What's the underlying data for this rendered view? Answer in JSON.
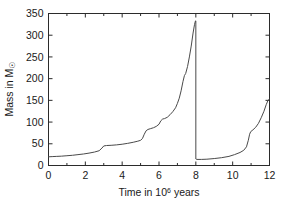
{
  "chart_data": {
    "type": "line",
    "title": "",
    "xlabel": "Time in 10^6 years",
    "xlabel_parts": {
      "pre": "Time in 10",
      "sup": "6",
      "post": " years"
    },
    "ylabel": "Mass in M☉",
    "ylabel_parts": {
      "pre": "Mass in M",
      "sym": "☉"
    },
    "xlim": [
      0,
      12
    ],
    "ylim": [
      0,
      350
    ],
    "xticks": [
      0,
      2,
      4,
      6,
      8,
      10,
      12
    ],
    "xtick_labels": [
      "0",
      "2",
      "4",
      "6",
      "8",
      "10",
      "12"
    ],
    "xminor_ticks": [
      1,
      3,
      5,
      7,
      9,
      11
    ],
    "yticks": [
      0,
      50,
      100,
      150,
      200,
      250,
      300,
      350
    ],
    "ytick_labels": [
      "0",
      "50",
      "100",
      "150",
      "200",
      "250",
      "300",
      "350"
    ],
    "grid": false,
    "legend": "none",
    "line_color": "#4a4a4a",
    "axis_color": "#2b2b2b",
    "background": "#ffffff",
    "series": [
      {
        "name": "Cluster mass",
        "points": [
          [
            0.0,
            20
          ],
          [
            0.2,
            20.5
          ],
          [
            0.45,
            21
          ],
          [
            0.7,
            21.5
          ],
          [
            1.0,
            22.5
          ],
          [
            1.3,
            23.5
          ],
          [
            1.6,
            25
          ],
          [
            1.9,
            26.5
          ],
          [
            2.2,
            28.5
          ],
          [
            2.5,
            31
          ],
          [
            2.75,
            34
          ],
          [
            2.9,
            40
          ],
          [
            3.0,
            45
          ],
          [
            3.15,
            46
          ],
          [
            3.4,
            46.5
          ],
          [
            3.7,
            47.5
          ],
          [
            4.0,
            49
          ],
          [
            4.3,
            51
          ],
          [
            4.6,
            53.5
          ],
          [
            4.85,
            56
          ],
          [
            5.0,
            58
          ],
          [
            5.1,
            62
          ],
          [
            5.2,
            72
          ],
          [
            5.3,
            80
          ],
          [
            5.4,
            83
          ],
          [
            5.55,
            85
          ],
          [
            5.7,
            87
          ],
          [
            5.85,
            90
          ],
          [
            6.0,
            95
          ],
          [
            6.1,
            103
          ],
          [
            6.2,
            107
          ],
          [
            6.3,
            108
          ],
          [
            6.45,
            111
          ],
          [
            6.6,
            117
          ],
          [
            6.75,
            124
          ],
          [
            6.9,
            133
          ],
          [
            7.0,
            143
          ],
          [
            7.1,
            155
          ],
          [
            7.2,
            172
          ],
          [
            7.3,
            193
          ],
          [
            7.38,
            207
          ],
          [
            7.45,
            212
          ],
          [
            7.55,
            228
          ],
          [
            7.65,
            250
          ],
          [
            7.75,
            275
          ],
          [
            7.85,
            305
          ],
          [
            7.93,
            325
          ],
          [
            7.98,
            333
          ],
          [
            8.0,
            333
          ],
          [
            8.0,
            15
          ],
          [
            8.05,
            14
          ],
          [
            8.3,
            14
          ],
          [
            8.6,
            14.5
          ],
          [
            9.0,
            16
          ],
          [
            9.4,
            18
          ],
          [
            9.8,
            21
          ],
          [
            10.1,
            25
          ],
          [
            10.4,
            30
          ],
          [
            10.6,
            35
          ],
          [
            10.75,
            43
          ],
          [
            10.85,
            58
          ],
          [
            10.92,
            72
          ],
          [
            10.98,
            78
          ],
          [
            11.1,
            82
          ],
          [
            11.25,
            88
          ],
          [
            11.4,
            97
          ],
          [
            11.55,
            110
          ],
          [
            11.7,
            125
          ],
          [
            11.82,
            140
          ],
          [
            11.92,
            150
          ],
          [
            12.0,
            153
          ]
        ]
      }
    ],
    "annotations": [
      {
        "text": "peak mass ~333 at t=8",
        "visible": false
      },
      {
        "text": "reset drop at t=8 to ~14",
        "visible": false
      }
    ]
  }
}
